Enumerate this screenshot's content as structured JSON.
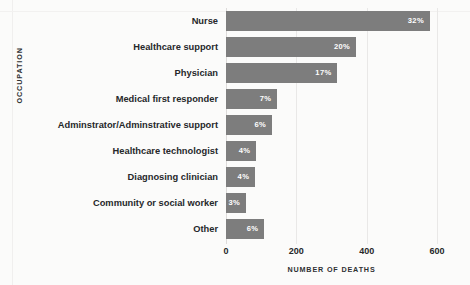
{
  "chart_data": {
    "type": "bar",
    "orientation": "horizontal",
    "title": "",
    "xlabel": "NUMBER OF DEATHS",
    "ylabel": "OCCUPATION",
    "xlim": [
      0,
      600
    ],
    "xticks": [
      "0",
      "200",
      "400",
      "600"
    ],
    "xtick_values": [
      0,
      200,
      400,
      600
    ],
    "grid": "vertical",
    "legend": "none",
    "bar_color": "#7d7d7d",
    "background_color": "#fbfbfa",
    "label_color": "#26282a",
    "value_label_color": "#ffffff",
    "gridline_color": "#e9e8e7",
    "categories": [
      "Nurse",
      "Healthcare support",
      "Physician",
      "Medical first responder",
      "Adminstrator/Adminstrative support",
      "Healthcare technologist",
      "Diagnosing clinician",
      "Community or social worker",
      "Other"
    ],
    "values": [
      580,
      370,
      317,
      146,
      131,
      86,
      83,
      57,
      109
    ],
    "data_labels": [
      "32%",
      "20%",
      "17%",
      "7%",
      "6%",
      "4%",
      "4%",
      "3%",
      "6%"
    ],
    "percentages": [
      32,
      20,
      17,
      7,
      6,
      4,
      4,
      3,
      6
    ]
  }
}
